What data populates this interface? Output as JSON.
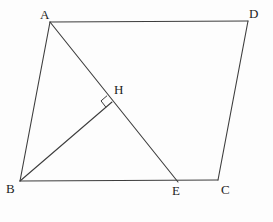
{
  "figure": {
    "background_color": "#fdfdfd",
    "stroke_color": "#3d3d3d",
    "label_color": "#1c1c1c",
    "stroke_width": 1.1,
    "width": 273,
    "height": 222
  },
  "points": {
    "A": {
      "label": "A",
      "x": 50,
      "y": 22,
      "label_x": 40,
      "label_y": 8
    },
    "B": {
      "label": "B",
      "x": 20,
      "y": 181,
      "label_x": 6,
      "label_y": 182
    },
    "C": {
      "label": "C",
      "x": 218,
      "y": 180,
      "label_x": 221,
      "label_y": 183
    },
    "D": {
      "label": "D",
      "x": 248,
      "y": 21,
      "label_x": 249,
      "label_y": 7
    },
    "E": {
      "label": "E",
      "x": 178,
      "y": 182,
      "label_x": 172,
      "label_y": 184
    },
    "H": {
      "label": "H",
      "x": 112,
      "y": 102,
      "label_x": 114,
      "label_y": 83
    }
  },
  "segments": [
    {
      "name": "side-AD",
      "from": "A",
      "to": "D"
    },
    {
      "name": "side-DC",
      "from": "D",
      "to": "C"
    },
    {
      "name": "side-BC",
      "from": "B",
      "to": "C"
    },
    {
      "name": "side-AB",
      "from": "A",
      "to": "B"
    },
    {
      "name": "diagonal-AE",
      "from": "A",
      "to": "E"
    },
    {
      "name": "altitude-BH",
      "from": "B",
      "to": "H"
    }
  ],
  "markers": {
    "right_angle": {
      "name": "right-angle-at-H",
      "vertex_x": 112,
      "vertex_y": 102,
      "size": 8,
      "description": "square marker indicating BH perpendicular to AE"
    }
  }
}
